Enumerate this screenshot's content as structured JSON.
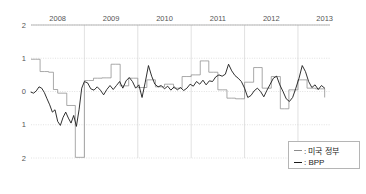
{
  "chart_data": {
    "type": "line",
    "title": "",
    "subtitle": "",
    "xlabel": "",
    "ylabel": "",
    "xlim": [
      2008.0,
      2013.6
    ],
    "ylim": [
      -2,
      2
    ],
    "grid": true,
    "xaxis_position": "top",
    "yticks": [
      2,
      1,
      0,
      -1,
      -2
    ],
    "ytick_labels": [
      "2",
      "1",
      "0",
      "1",
      "2"
    ],
    "xticks": [
      2008,
      2009,
      2010,
      2011,
      2012,
      2013
    ],
    "xtick_labels": [
      "2008",
      "2009",
      "2010",
      "2011",
      "2012",
      "2013"
    ],
    "legend_position": "bottom-right",
    "series": [
      {
        "name": "미국 정부",
        "legend_label": ": 미국 정부",
        "color": "#8c8c8c",
        "style": "step",
        "x": [
          2008.0,
          2008.08,
          2008.17,
          2008.25,
          2008.33,
          2008.42,
          2008.5,
          2008.58,
          2008.67,
          2008.75,
          2008.83,
          2008.92,
          2009.0,
          2009.08,
          2009.17,
          2009.25,
          2009.33,
          2009.42,
          2009.5,
          2009.58,
          2009.67,
          2009.75,
          2009.83,
          2009.92,
          2010.0,
          2010.08,
          2010.17,
          2010.25,
          2010.33,
          2010.42,
          2010.5,
          2010.58,
          2010.67,
          2010.75,
          2010.83,
          2010.92,
          2011.0,
          2011.08,
          2011.17,
          2011.25,
          2011.33,
          2011.42,
          2011.5,
          2011.58,
          2011.67,
          2011.75,
          2011.83,
          2011.92,
          2012.0,
          2012.08,
          2012.17,
          2012.25,
          2012.33,
          2012.42,
          2012.5,
          2012.58,
          2012.67,
          2012.75,
          2012.83,
          2012.92,
          2013.0,
          2013.08,
          2013.17,
          2013.25,
          2013.33,
          2013.42,
          2013.5
        ],
        "values": [
          0.97,
          0.97,
          0.6,
          0.6,
          0.58,
          0.06,
          -0.05,
          -0.05,
          -0.42,
          -0.42,
          -1.98,
          -1.98,
          0.33,
          0.33,
          0.4,
          0.4,
          0.41,
          0.41,
          0.82,
          0.82,
          0.17,
          0.17,
          0.4,
          0.4,
          0.12,
          0.12,
          0.35,
          0.35,
          0.14,
          0.14,
          0.22,
          0.22,
          0.1,
          0.1,
          0.45,
          0.45,
          0.5,
          0.5,
          0.92,
          0.92,
          0.58,
          0.58,
          0.05,
          0.05,
          -0.2,
          -0.2,
          -0.22,
          -0.22,
          0.28,
          0.28,
          0.72,
          0.72,
          0.1,
          0.1,
          0.45,
          0.45,
          -0.52,
          -0.52,
          0.05,
          0.05,
          0.35,
          0.35,
          0.1,
          0.1,
          0.08,
          0.08,
          -0.18
        ]
      },
      {
        "name": "BPP",
        "legend_label": ": BPP",
        "color": "#1a1a1a",
        "style": "line",
        "x": [
          2008.0,
          2008.05,
          2008.1,
          2008.15,
          2008.2,
          2008.25,
          2008.3,
          2008.35,
          2008.4,
          2008.45,
          2008.5,
          2008.55,
          2008.6,
          2008.65,
          2008.7,
          2008.75,
          2008.8,
          2008.85,
          2008.9,
          2008.95,
          2009.0,
          2009.06,
          2009.12,
          2009.18,
          2009.24,
          2009.3,
          2009.36,
          2009.42,
          2009.48,
          2009.54,
          2009.6,
          2009.66,
          2009.72,
          2009.78,
          2009.84,
          2009.9,
          2009.96,
          2010.02,
          2010.08,
          2010.14,
          2010.2,
          2010.26,
          2010.32,
          2010.38,
          2010.44,
          2010.5,
          2010.56,
          2010.62,
          2010.68,
          2010.74,
          2010.8,
          2010.86,
          2010.92,
          2010.98,
          2011.04,
          2011.1,
          2011.16,
          2011.22,
          2011.28,
          2011.34,
          2011.4,
          2011.46,
          2011.52,
          2011.58,
          2011.64,
          2011.7,
          2011.76,
          2011.82,
          2011.88,
          2011.94,
          2012.0,
          2012.06,
          2012.12,
          2012.18,
          2012.24,
          2012.3,
          2012.36,
          2012.42,
          2012.48,
          2012.54,
          2012.6,
          2012.66,
          2012.72,
          2012.78,
          2012.84,
          2012.9,
          2012.96,
          2013.02,
          2013.08,
          2013.14,
          2013.2,
          2013.26,
          2013.32,
          2013.38,
          2013.44,
          2013.5
        ],
        "values": [
          -0.02,
          -0.05,
          0.02,
          0.14,
          0.1,
          -0.03,
          -0.22,
          -0.4,
          -0.62,
          -0.55,
          -0.9,
          -1.02,
          -0.78,
          -0.62,
          -0.8,
          -0.95,
          -0.72,
          -1.05,
          -0.55,
          0.1,
          0.3,
          0.26,
          0.08,
          0.04,
          0.14,
          0.04,
          -0.1,
          0.06,
          0.18,
          0.06,
          0.18,
          0.3,
          0.1,
          0.32,
          0.42,
          0.3,
          0.1,
          0.2,
          -0.18,
          0.28,
          0.78,
          0.46,
          0.22,
          0.14,
          0.18,
          0.08,
          0.16,
          0.04,
          0.14,
          0.05,
          0.12,
          0.03,
          0.1,
          0.22,
          0.16,
          0.3,
          0.22,
          0.34,
          0.2,
          0.32,
          0.3,
          0.44,
          0.5,
          0.46,
          0.52,
          0.82,
          0.62,
          0.48,
          0.4,
          0.3,
          0.1,
          -0.18,
          -0.12,
          0.02,
          0.1,
          0.0,
          -0.16,
          0.04,
          0.22,
          0.4,
          0.46,
          0.2,
          0.0,
          -0.22,
          -0.3,
          -0.18,
          0.1,
          0.4,
          0.78,
          0.6,
          0.3,
          0.12,
          0.2,
          0.06,
          0.18,
          0.1
        ]
      }
    ]
  },
  "legend": {
    "items": [
      {
        "label": ": 미국 정부",
        "color": "#8c8c8c"
      },
      {
        "label": ": BPP",
        "color": "#1a1a1a"
      }
    ]
  }
}
